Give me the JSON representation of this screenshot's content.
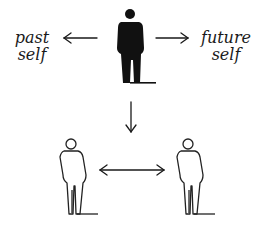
{
  "diagram": {
    "labels": {
      "past_line1": "past",
      "past_line2": "self",
      "future_line1": "future",
      "future_line2": "self"
    },
    "nodes": [
      {
        "id": "present-self",
        "style": "filled",
        "color": "#111111"
      },
      {
        "id": "other-left",
        "style": "outline",
        "color": "#222222"
      },
      {
        "id": "other-right",
        "style": "outline",
        "color": "#222222"
      }
    ],
    "edges": [
      {
        "from": "present-self",
        "to": "past-self",
        "direction": "left"
      },
      {
        "from": "present-self",
        "to": "future-self",
        "direction": "right"
      },
      {
        "from": "present-self",
        "to": "others",
        "direction": "down"
      },
      {
        "from": "other-left",
        "to": "other-right",
        "direction": "bidirectional"
      }
    ],
    "colors": {
      "ink": "#111111",
      "background": "#ffffff"
    }
  }
}
